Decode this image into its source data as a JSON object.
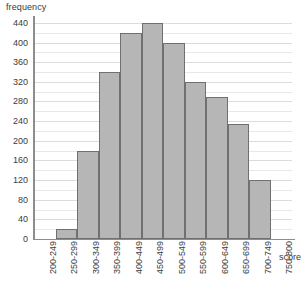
{
  "chart_data": {
    "type": "bar",
    "title": "",
    "subtitle": "",
    "xlabel": "score",
    "ylabel": "frequency",
    "categories": [
      "200-249",
      "250-299",
      "300-349",
      "350-399",
      "400-449",
      "450-499",
      "500-549",
      "550-599",
      "600-649",
      "650-699",
      "700-749",
      "750-800"
    ],
    "values": [
      0,
      20,
      180,
      340,
      420,
      440,
      400,
      320,
      290,
      235,
      120,
      0
    ],
    "ylim": [
      0,
      450
    ],
    "xlim": null,
    "y_tick_labels": [
      "0",
      "40",
      "80",
      "120",
      "160",
      "200",
      "240",
      "280",
      "320",
      "360",
      "400",
      "440"
    ],
    "y_tick_values": [
      0,
      40,
      80,
      120,
      160,
      200,
      240,
      280,
      320,
      360,
      400,
      440
    ],
    "minor_gridline_step": 20,
    "grid": true,
    "legend": null,
    "legend_position": "none",
    "bar_fill_color": "#b6b6b6",
    "bar_border_color": "#707070",
    "gridline_color": "#e8e8e8",
    "axis_color": "#8d8d8d",
    "text_color": "#3c3c3c",
    "x_label_rotation_degrees": -90
  },
  "axes": {
    "y_title": "frequency",
    "x_title": "score"
  }
}
